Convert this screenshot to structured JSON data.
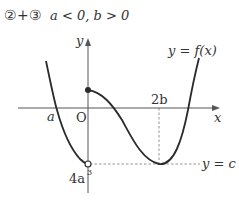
{
  "title": {
    "case": "②+③",
    "condition": "a < 0,  b > 0"
  },
  "axes": {
    "x_label": "x",
    "y_label": "y",
    "origin_label": "O"
  },
  "labels": {
    "a": "a",
    "two_b": "2b",
    "four_a_cubed_base": "4a",
    "four_a_cubed_exp": "3",
    "curve": "y = f(x)",
    "line_c": "y = c"
  },
  "colors": {
    "curve": "#2a2a2a",
    "axis": "#555555",
    "dashed": "#888888",
    "text": "#333333"
  }
}
